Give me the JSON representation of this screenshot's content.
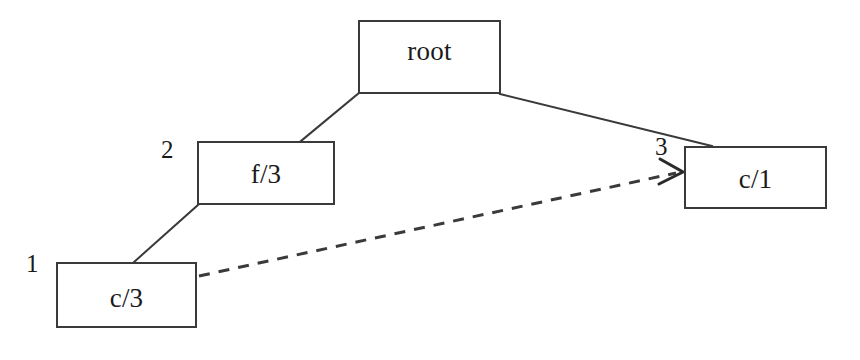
{
  "diagram": {
    "type": "node-link-diagram",
    "background_color": "#ffffff",
    "stroke_color": "#3a3a3a",
    "text_color": "#1a1a1a",
    "canvas": {
      "width": 860,
      "height": 360
    },
    "nodes": [
      {
        "id": "root",
        "label": "root",
        "index_label": "",
        "x": 358,
        "y": 20,
        "width": 143,
        "height": 74
      },
      {
        "id": "f3",
        "label": "f/3",
        "index_label": "2",
        "index_x": 161,
        "index_y": 137,
        "x": 197,
        "y": 141,
        "width": 138,
        "height": 64
      },
      {
        "id": "c1",
        "label": "c/1",
        "index_label": "3",
        "index_x": 655,
        "index_y": 134,
        "x": 684,
        "y": 146,
        "width": 143,
        "height": 63
      },
      {
        "id": "c3",
        "label": "c/3",
        "index_label": "1",
        "index_x": 26,
        "index_y": 251,
        "x": 56,
        "y": 262,
        "width": 141,
        "height": 66
      }
    ],
    "edges": [
      {
        "id": "root-to-f3",
        "from": "root",
        "to": "f3",
        "style": "solid",
        "arrow": false,
        "x1": 359,
        "y1": 93,
        "x2": 301,
        "y2": 141
      },
      {
        "id": "root-to-c1",
        "from": "root",
        "to": "c1",
        "style": "solid",
        "arrow": false,
        "x1": 500,
        "y1": 94,
        "x2": 712,
        "y2": 146
      },
      {
        "id": "f3-to-c3",
        "from": "f3",
        "to": "c3",
        "style": "solid",
        "arrow": false,
        "x1": 198,
        "y1": 205,
        "x2": 134,
        "y2": 262
      },
      {
        "id": "c3-to-c1",
        "from": "c3",
        "to": "c1",
        "style": "dashed",
        "arrow": true,
        "x1": 199,
        "y1": 276,
        "x2": 682,
        "y2": 172
      }
    ]
  }
}
